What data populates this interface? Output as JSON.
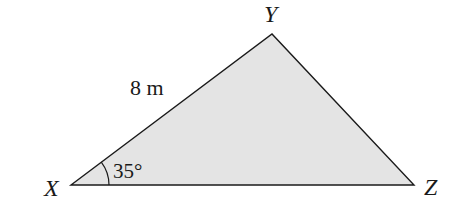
{
  "diagram": {
    "type": "triangle",
    "fill_color": "#e4e4e4",
    "stroke_color": "#1a1a1a",
    "vertices": [
      {
        "label": "X",
        "x": 71,
        "y": 185
      },
      {
        "label": "Y",
        "x": 272,
        "y": 34
      },
      {
        "label": "Z",
        "x": 414,
        "y": 185
      }
    ],
    "side_labels": [
      {
        "side": "XY",
        "text": "8 m"
      }
    ],
    "angle_labels": [
      {
        "vertex": "X",
        "text": "35°"
      }
    ]
  }
}
